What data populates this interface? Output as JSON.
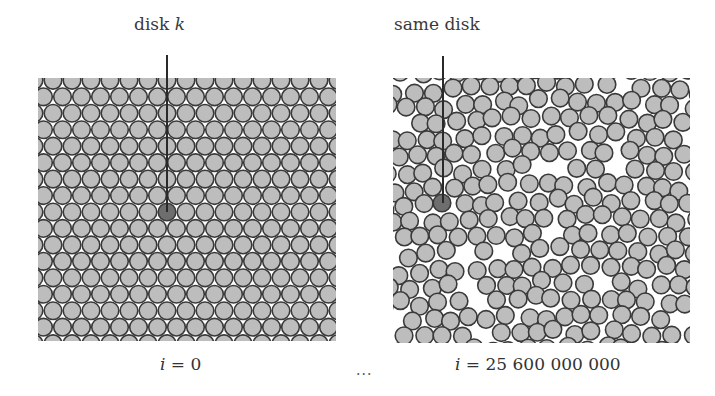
{
  "figure": {
    "left": {
      "callout_label": "disk",
      "callout_var": "k",
      "caption_var": "i",
      "caption_eq": "=",
      "caption_value": "0",
      "box": {
        "x": 38,
        "y": 78,
        "w": 298,
        "h": 263
      },
      "marked_disk": {
        "cx": 167,
        "cy": 212
      },
      "line": {
        "x": 167,
        "y1": 55
      }
    },
    "right": {
      "callout_label": "same disk",
      "caption_var": "i",
      "caption_eq": "=",
      "caption_value": "25 600 000 000",
      "box": {
        "x": 393,
        "y": 78,
        "w": 297,
        "h": 265
      },
      "marked_disk": {
        "cx": 442,
        "cy": 203
      },
      "line": {
        "x": 443,
        "y1": 56
      }
    },
    "ellipsis": "...",
    "disk": {
      "radius": 8.8,
      "spacing": 19.0,
      "fill": "#bdbdbd",
      "stroke": "#3a3a3a",
      "marked_fill": "#6e6e6e",
      "background": "#ffffff",
      "box_tint": "#d4d4d4"
    }
  }
}
